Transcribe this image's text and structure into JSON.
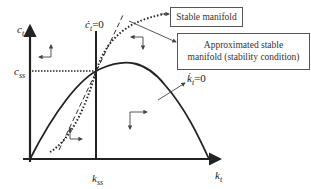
{
  "diagram": {
    "type": "phase diagram",
    "axes": {
      "y_label": "c",
      "y_label_sub": "t",
      "x_label": "k",
      "x_label_sub": "t"
    },
    "steady_state": {
      "c_label": "c",
      "c_label_sub": "ss",
      "k_label": "k",
      "k_label_sub": "ss"
    },
    "loci": {
      "c_dot_zero": {
        "symbol": "ċ",
        "sub": "t",
        "eq": "=0"
      },
      "k_dot_zero": {
        "symbol": "k̇",
        "sub": "t",
        "eq": "=0"
      }
    },
    "callouts": {
      "stable_manifold": "Stable manifold",
      "approx_line1": "Approximated stable",
      "approx_line2": "manifold (stability condition)"
    },
    "line_styles": {
      "stable_manifold": "dotted",
      "approximated_manifold": "dashed",
      "k_dot_zero": "solid",
      "c_dot_zero": "solid"
    },
    "direction_arrows": [
      {
        "region": "upper-left",
        "dx": "left",
        "dy": "up"
      },
      {
        "region": "upper-right",
        "dx": "left",
        "dy": "down"
      },
      {
        "region": "lower-right",
        "dx": "right",
        "dy": "down"
      },
      {
        "region": "lower-left",
        "dx": "right",
        "dy": "up"
      }
    ],
    "colors": {
      "ink": "#222222",
      "callout_line": "#444444"
    }
  }
}
